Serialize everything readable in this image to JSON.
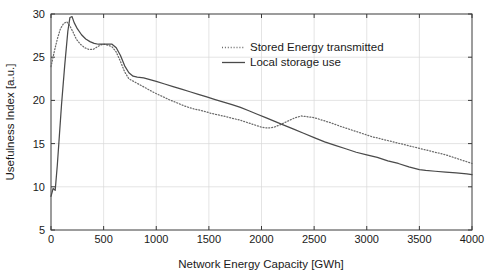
{
  "chart_data": {
    "type": "line",
    "title": "",
    "xlabel": "Network Energy Capacity [GWh]",
    "ylabel": "Usefulness Index [a.u.]",
    "xlim": [
      0,
      4000
    ],
    "ylim": [
      5,
      30
    ],
    "xticks": [
      0,
      500,
      1000,
      1500,
      2000,
      2500,
      3000,
      3500,
      4000
    ],
    "yticks": [
      5,
      10,
      15,
      20,
      25,
      30
    ],
    "xtick_labels": [
      "0",
      "500",
      "1000",
      "1500",
      "2000",
      "2500",
      "3000",
      "3500",
      "4000"
    ],
    "ytick_labels": [
      "5",
      "10",
      "15",
      "20",
      "25",
      "30"
    ],
    "grid": true,
    "legend_position": "upper-center-right",
    "colors": {
      "solid": "#4a4a4a",
      "dotted": "#6a6a6a",
      "axis": "#3a3a3a",
      "grid": "#d9d9d9",
      "background": "#ffffff"
    },
    "series": [
      {
        "name": "Stored Energy transmitted",
        "style": "dotted",
        "x": [
          0,
          30,
          60,
          90,
          120,
          150,
          180,
          210,
          240,
          280,
          320,
          360,
          400,
          440,
          470,
          500,
          540,
          580,
          620,
          660,
          700,
          740,
          800,
          860,
          920,
          980,
          1050,
          1120,
          1200,
          1280,
          1360,
          1440,
          1520,
          1600,
          1700,
          1800,
          1900,
          2000,
          2060,
          2120,
          2180,
          2250,
          2320,
          2380,
          2440,
          2500,
          2580,
          2660,
          2750,
          2850,
          2950,
          3050,
          3150,
          3250,
          3350,
          3450,
          3550,
          3650,
          3750,
          3850,
          3950,
          4000
        ],
        "y": [
          23.9,
          25.6,
          27.1,
          28.3,
          28.9,
          29.1,
          28.6,
          27.9,
          27.1,
          26.5,
          26.1,
          25.9,
          25.9,
          26.2,
          26.4,
          26.5,
          26.4,
          26.2,
          25.6,
          24.5,
          23.3,
          22.5,
          22.1,
          21.7,
          21.3,
          20.9,
          20.5,
          20.1,
          19.7,
          19.3,
          19.0,
          18.8,
          18.5,
          18.3,
          18.0,
          17.7,
          17.3,
          16.9,
          16.8,
          16.9,
          17.2,
          17.6,
          18.0,
          18.2,
          18.1,
          18.0,
          17.7,
          17.4,
          17.0,
          16.6,
          16.2,
          15.8,
          15.5,
          15.2,
          14.9,
          14.6,
          14.3,
          14.0,
          13.7,
          13.3,
          12.9,
          12.7
        ]
      },
      {
        "name": "Local storage use",
        "style": "solid",
        "x": [
          0,
          20,
          40,
          60,
          80,
          100,
          130,
          160,
          180,
          200,
          220,
          250,
          290,
          330,
          370,
          410,
          450,
          480,
          500,
          540,
          580,
          620,
          660,
          700,
          740,
          780,
          820,
          880,
          940,
          1000,
          1080,
          1160,
          1240,
          1320,
          1400,
          1480,
          1560,
          1640,
          1720,
          1800,
          1880,
          1960,
          2040,
          2120,
          2200,
          2300,
          2400,
          2500,
          2600,
          2700,
          2800,
          2900,
          3000,
          3100,
          3200,
          3300,
          3400,
          3500,
          3560,
          3650,
          3750,
          3850,
          3950,
          4000
        ],
        "y": [
          8.9,
          9.8,
          9.6,
          12.5,
          16.0,
          19.5,
          24.0,
          28.0,
          29.6,
          29.7,
          29.0,
          28.3,
          27.6,
          27.1,
          26.8,
          26.6,
          26.5,
          26.5,
          26.5,
          26.5,
          26.5,
          26.1,
          25.2,
          24.0,
          23.2,
          22.8,
          22.7,
          22.6,
          22.4,
          22.2,
          21.9,
          21.6,
          21.3,
          21.0,
          20.7,
          20.4,
          20.1,
          19.8,
          19.5,
          19.2,
          18.8,
          18.4,
          18.0,
          17.6,
          17.2,
          16.7,
          16.2,
          15.7,
          15.2,
          14.8,
          14.4,
          14.0,
          13.7,
          13.4,
          13.0,
          12.7,
          12.3,
          12.0,
          11.9,
          11.8,
          11.7,
          11.6,
          11.5,
          11.4
        ]
      }
    ]
  },
  "legend": {
    "entries": [
      {
        "label": "Stored Energy transmitted",
        "style": "dotted"
      },
      {
        "label": "Local storage use",
        "style": "solid"
      }
    ]
  },
  "icons": {
    "legend_dotted_sample": "dotted-line-icon",
    "legend_solid_sample": "solid-line-icon"
  }
}
